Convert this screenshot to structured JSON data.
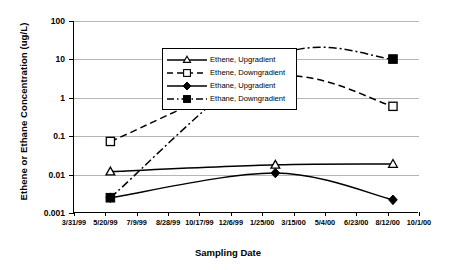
{
  "chart_data": {
    "type": "line",
    "title": "",
    "xlabel": "Sampling Date",
    "ylabel": "Ethene or Ethane Concentration (ug/L)",
    "yscale": "log",
    "ylim": [
      0.001,
      100
    ],
    "ytick_labels": [
      "100",
      "10",
      "1",
      "0.1",
      "0.01",
      "0.001"
    ],
    "ytick_values": [
      100,
      10,
      1,
      0.1,
      0.01,
      0.001
    ],
    "xtick_labels": [
      "3/31/99",
      "5/20/99",
      "7/9/99",
      "8/28/99",
      "10/17/99",
      "12/6/99",
      "1/25/00",
      "3/15/00",
      "5/4/00",
      "6/23/00",
      "8/12/00",
      "10/1/00"
    ],
    "grid": "horizontal",
    "legend_position": "upper-left-inside",
    "x_sample_labels": [
      "5/28/99",
      "2/15/00",
      "8/20/00"
    ],
    "series": [
      {
        "name": "Ethene, Upgradient",
        "marker": "open-triangle",
        "line": "solid",
        "color": "#000000",
        "values": [
          0.012,
          0.018,
          0.019
        ]
      },
      {
        "name": "Ethene, Downgradient",
        "marker": "open-square",
        "line": "dashed",
        "color": "#000000",
        "values": [
          0.073,
          3.6,
          0.6
        ]
      },
      {
        "name": "Ethane, Upgradient",
        "marker": "filled-diamond",
        "line": "solid",
        "color": "#000000",
        "values": [
          0.0025,
          0.011,
          0.0022
        ]
      },
      {
        "name": "Ethane, Downgradient",
        "marker": "filled-square",
        "line": "dash-dot",
        "color": "#000000",
        "values": [
          0.0025,
          11.5,
          10.2
        ]
      }
    ]
  },
  "axes": {
    "y_title": "Ethene or Ethane Concentration (ug/L)",
    "x_title": "Sampling Date"
  },
  "legend": {
    "items": [
      {
        "label": "Ethene, Upgradient"
      },
      {
        "label": "Ethene, Downgradient"
      },
      {
        "label": "Ethane, Upgradient"
      },
      {
        "label": "Ethane, Downgradient"
      }
    ]
  }
}
